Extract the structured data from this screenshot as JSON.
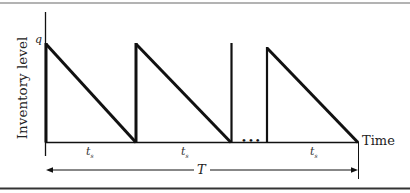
{
  "diagram": {
    "type": "inventory-sawtooth",
    "y_axis_label": "Inventory level",
    "peak_label": "q",
    "x_axis_label": "Time",
    "cycle_label_main": "t",
    "cycle_label_sub": "s",
    "total_label": "T",
    "ellipsis": "•••",
    "colors": {
      "line": "#111111",
      "top_rule": "#9a9a9a",
      "bottom_rule": "#333333",
      "background": "#ffffff"
    }
  }
}
